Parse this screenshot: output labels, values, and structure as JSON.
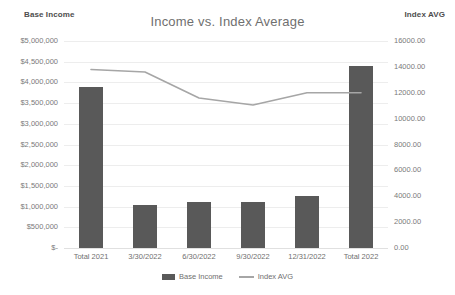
{
  "chart_data": {
    "type": "bar",
    "title": "Income vs. Index Average",
    "xlabel": "",
    "ylabel": "Base Income",
    "y2label": "Index AVG",
    "grid": true,
    "legend_position": "bottom",
    "categories": [
      "Total 2021",
      "3/30/2022",
      "6/30/2022",
      "9/30/2022",
      "12/31/2022",
      "Total 2022"
    ],
    "series": [
      {
        "name": "Base Income",
        "type": "bar",
        "axis": "left",
        "color": "#595959",
        "values": [
          3880000,
          1050000,
          1100000,
          1120000,
          1250000,
          4400000
        ]
      },
      {
        "name": "Index AVG",
        "type": "line",
        "axis": "right",
        "color": "#a6a6a6",
        "values": [
          13800,
          13600,
          11600,
          11050,
          12000,
          12000
        ]
      }
    ],
    "ylim": [
      0,
      5000000
    ],
    "y2lim": [
      0,
      16000
    ],
    "yticks": [
      "$-",
      "$500,000",
      "$1,000,000",
      "$1,500,000",
      "$2,000,000",
      "$2,500,000",
      "$3,000,000",
      "$3,500,000",
      "$4,000,000",
      "$4,500,000",
      "$5,000,000"
    ],
    "ytick_values": [
      0,
      500000,
      1000000,
      1500000,
      2000000,
      2500000,
      3000000,
      3500000,
      4000000,
      4500000,
      5000000
    ],
    "y2ticks": [
      "0.00",
      "2000.00",
      "4000.00",
      "6000.00",
      "8000.00",
      "10000.00",
      "12000.00",
      "14000.00",
      "16000.00"
    ],
    "y2tick_values": [
      0,
      2000,
      4000,
      6000,
      8000,
      10000,
      12000,
      14000,
      16000
    ]
  },
  "legend": [
    {
      "label": "Base Income",
      "marker": "bar-swatch"
    },
    {
      "label": "Index AVG",
      "marker": "line-swatch"
    }
  ]
}
